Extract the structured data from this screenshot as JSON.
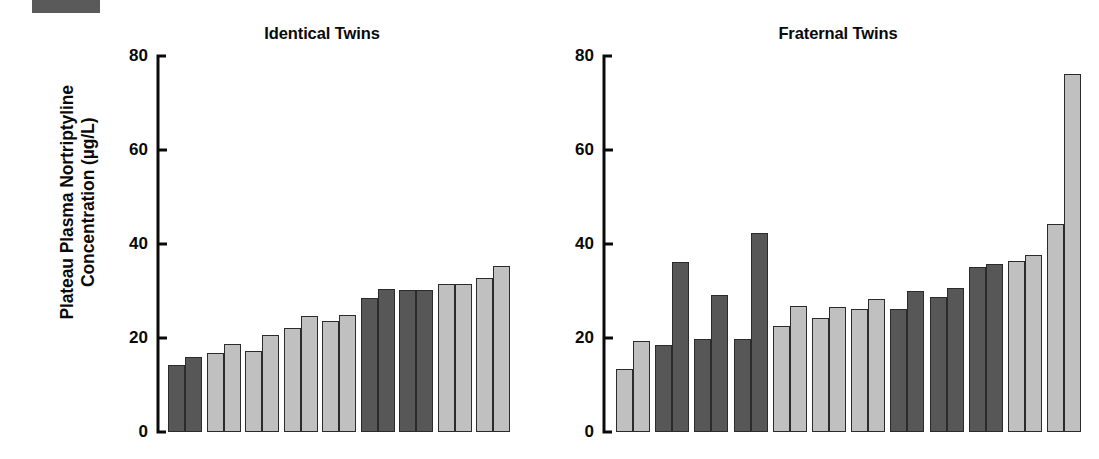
{
  "figure": {
    "ylabel": "Plateau Plasma Nortriptyline\nConcentration (µg/L)",
    "artifact_name": "scan-edge-artifact"
  },
  "chart_data": {
    "type": "bar",
    "title": "",
    "xlabel": "",
    "ylabel": "Plateau Plasma Nortriptyline Concentration (µg/L)",
    "ylim": [
      0,
      80
    ],
    "yticks": [
      0,
      20,
      40,
      60,
      80
    ],
    "ytick_labels": [
      "0",
      "20",
      "40",
      "60",
      "80"
    ],
    "grid": false,
    "legend": "none",
    "units": "µg/L",
    "series_names": [
      "Twin A",
      "Twin B"
    ],
    "colors": {
      "dark": "#575757",
      "light": "#c0c0c0",
      "outline": "#2b2b2b",
      "text": "#0a0a0a",
      "background": "#ffffff"
    },
    "panels": [
      {
        "id": "identical-twins",
        "title": "Identical Twins",
        "n_pairs": 9,
        "categories": [
          "1",
          "2",
          "3",
          "4",
          "5",
          "6",
          "7",
          "8",
          "9"
        ],
        "pairs": [
          {
            "index": 1,
            "shade": "dark",
            "twin_a": 14.2,
            "twin_b": 16.0
          },
          {
            "index": 2,
            "shade": "light",
            "twin_a": 16.9,
            "twin_b": 18.7
          },
          {
            "index": 3,
            "shade": "light",
            "twin_a": 17.3,
            "twin_b": 20.6
          },
          {
            "index": 4,
            "shade": "light",
            "twin_a": 22.2,
            "twin_b": 24.6
          },
          {
            "index": 5,
            "shade": "light",
            "twin_a": 23.7,
            "twin_b": 24.8
          },
          {
            "index": 6,
            "shade": "dark",
            "twin_a": 28.6,
            "twin_b": 30.5
          },
          {
            "index": 7,
            "shade": "dark",
            "twin_a": 30.2,
            "twin_b": 30.3
          },
          {
            "index": 8,
            "shade": "light",
            "twin_a": 31.4,
            "twin_b": 31.5
          },
          {
            "index": 9,
            "shade": "light",
            "twin_a": 32.7,
            "twin_b": 35.4
          }
        ],
        "series": [
          {
            "name": "Twin A",
            "values": [
              14.2,
              16.9,
              17.3,
              22.2,
              23.7,
              28.6,
              30.2,
              31.4,
              32.7
            ]
          },
          {
            "name": "Twin B",
            "values": [
              16.0,
              18.7,
              20.6,
              24.6,
              24.8,
              30.5,
              30.3,
              31.5,
              35.4
            ]
          }
        ]
      },
      {
        "id": "fraternal-twins",
        "title": "Fraternal Twins",
        "n_pairs": 11,
        "categories": [
          "1",
          "2",
          "3",
          "4",
          "5",
          "6",
          "7",
          "8",
          "9",
          "10",
          "11"
        ],
        "pairs": [
          {
            "index": 1,
            "shade": "light",
            "twin_a": 13.5,
            "twin_b": 19.4
          },
          {
            "index": 2,
            "shade": "dark",
            "twin_a": 18.5,
            "twin_b": 36.1
          },
          {
            "index": 3,
            "shade": "dark",
            "twin_a": 19.7,
            "twin_b": 29.2
          },
          {
            "index": 4,
            "shade": "dark",
            "twin_a": 19.8,
            "twin_b": 42.4
          },
          {
            "index": 5,
            "shade": "light",
            "twin_a": 22.6,
            "twin_b": 26.9
          },
          {
            "index": 6,
            "shade": "light",
            "twin_a": 24.3,
            "twin_b": 26.6
          },
          {
            "index": 7,
            "shade": "light",
            "twin_a": 26.1,
            "twin_b": 28.4
          },
          {
            "index": 8,
            "shade": "dark",
            "twin_a": 26.2,
            "twin_b": 30.0
          },
          {
            "index": 9,
            "shade": "dark",
            "twin_a": 28.8,
            "twin_b": 30.6
          },
          {
            "index": 10,
            "shade": "dark",
            "twin_a": 35.1,
            "twin_b": 35.7
          },
          {
            "index": 11,
            "shade": "light",
            "twin_a": 36.4,
            "twin_b": 37.6
          },
          {
            "index": 12,
            "shade": "light",
            "twin_a": 44.3,
            "twin_b": 76.2
          }
        ],
        "series": [
          {
            "name": "Twin A",
            "values": [
              13.5,
              18.5,
              19.7,
              19.8,
              22.6,
              24.3,
              26.1,
              26.2,
              28.8,
              35.1,
              36.4,
              44.3
            ]
          },
          {
            "name": "Twin B",
            "values": [
              19.4,
              36.1,
              29.2,
              42.4,
              26.9,
              26.6,
              28.4,
              30.0,
              30.6,
              35.7,
              37.6,
              76.2
            ]
          }
        ]
      }
    ]
  }
}
